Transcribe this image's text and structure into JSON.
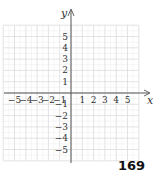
{
  "diagram": {
    "type": "coordinate-plane",
    "x_axis_label": "x",
    "y_axis_label": "y",
    "x_range": [
      -6,
      6
    ],
    "y_range": [
      -6,
      6
    ],
    "grid": {
      "major_step": 1,
      "minor_step": 0.5
    },
    "x_ticks": [
      "−5",
      "−4",
      "−3",
      "−2",
      "−1",
      "1",
      "2",
      "3",
      "4",
      "5"
    ],
    "x_tick_values": [
      -5,
      -4,
      -3,
      -2,
      -1,
      1,
      2,
      3,
      4,
      5
    ],
    "y_ticks": [
      "5",
      "4",
      "3",
      "2",
      "1",
      "−1",
      "−2",
      "−3",
      "−4",
      "−5"
    ],
    "y_tick_values": [
      5,
      4,
      3,
      2,
      1,
      -1,
      -2,
      -3,
      -4,
      -5
    ],
    "colors": {
      "grid_major": "#dcdcdc",
      "grid_minor": "#efefef",
      "axis": "#555555",
      "text": "#333333"
    }
  },
  "page": {
    "number": "169"
  }
}
